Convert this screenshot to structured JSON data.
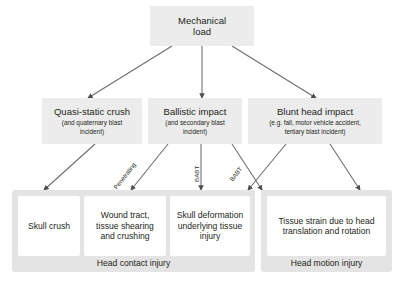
{
  "diagram": {
    "root": {
      "title": "Mechanical\nload",
      "title_line1": "Mechanical",
      "title_line2": "load"
    },
    "causes": [
      {
        "id": "quasi-static-crush",
        "title": "Quasi-static crush",
        "sub_line1": "(and quaternary blast",
        "sub_line2": "incident)"
      },
      {
        "id": "ballistic-impact",
        "title": "Ballistic impact",
        "sub_line1": "(and secondary blast",
        "sub_line2": "incident)"
      },
      {
        "id": "blunt-head-impact",
        "title": "Blunt head impact",
        "sub_line1": "(e.g. fall, motor vehicle accident,",
        "sub_line2": "tertiary blast incident)"
      }
    ],
    "edge_labels": [
      {
        "id": "penetrating",
        "text": "Penetrating"
      },
      {
        "id": "babt-center",
        "text": "BABT"
      },
      {
        "id": "babt-right",
        "text": "BABT"
      }
    ],
    "groups": [
      {
        "id": "head-contact-injury",
        "label": "Head contact injury",
        "leaves": [
          {
            "id": "skull-crush",
            "text": "Skull crush"
          },
          {
            "id": "wound-tract",
            "line1": "Wound tract,",
            "line2": "tissue shearing",
            "line3": "and crushing"
          },
          {
            "id": "skull-deformation",
            "line1": "Skull deformation",
            "line2": "underlying tissue",
            "line3": "injury"
          }
        ]
      },
      {
        "id": "head-motion-injury",
        "label": "Head motion injury",
        "leaves": [
          {
            "id": "tissue-strain",
            "line1": "Tissue strain due to head",
            "line2": "translation and rotation"
          }
        ]
      }
    ],
    "colors": {
      "node_fill": "#ececec",
      "group_fill": "#e4e4e4",
      "leaf_fill": "#ffffff",
      "arrow": "#4d4d4d",
      "text": "#231f20",
      "background": "#ffffff"
    }
  }
}
